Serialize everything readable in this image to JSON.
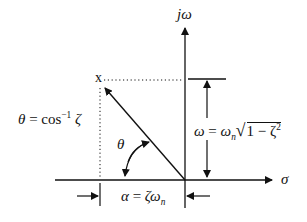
{
  "diagram": {
    "colors": {
      "ink": "#111111",
      "background": "#ffffff"
    },
    "axes": {
      "vertical_label": "jω",
      "horizontal_label": "σ"
    },
    "pole": {
      "marker": "x"
    },
    "labels": {
      "theta_def": {
        "lhs": "θ",
        "eq": " = cos",
        "sup": "−1",
        "rhs": " ζ"
      },
      "theta_angle": "θ",
      "omega_def": {
        "lhs": "ω",
        "eq": " = ",
        "wn": "ω",
        "wn_sub": "n",
        "radicand": "1 − ζ",
        "radicand_sup": "2"
      },
      "alpha_def": {
        "lhs": "α",
        "eq": " = ",
        "zeta": "ζ",
        "wn": "ω",
        "wn_sub": "n"
      }
    }
  }
}
